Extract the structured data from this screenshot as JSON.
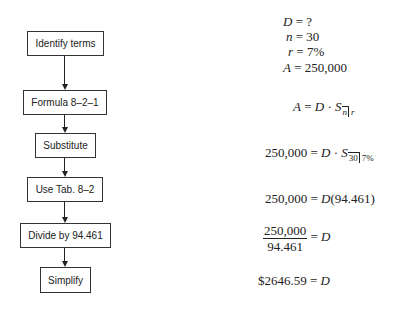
{
  "flowchart": {
    "steps": [
      {
        "label": "Identify terms"
      },
      {
        "label": "Formula 8–2–1"
      },
      {
        "label": "Substitute"
      },
      {
        "label": "Use Tab. 8–2"
      },
      {
        "label": "Divide by 94.461"
      },
      {
        "label": "Simplify"
      }
    ]
  },
  "equations": {
    "terms": {
      "d": {
        "var": "D",
        "op": "=",
        "val": "?"
      },
      "n": {
        "var": "n",
        "op": "=",
        "val": "30"
      },
      "r": {
        "var": "r",
        "op": "=",
        "val": "7%"
      },
      "a": {
        "var": "A",
        "op": "=",
        "val": "250,000"
      }
    },
    "formula": {
      "lhs": "A",
      "op": "=",
      "d": "D",
      "dot": "·",
      "s": "S",
      "sub_n": "n",
      "sub_r": "r"
    },
    "substitute": {
      "lhs": "250,000",
      "op": "=",
      "d": "D",
      "dot": "·",
      "s": "S",
      "sub_n": "30",
      "sub_r": "7%"
    },
    "table": {
      "lhs": "250,000",
      "op": "=",
      "d": "D",
      "rhs": "(94.461)"
    },
    "divide": {
      "num": "250,000",
      "den": "94.461",
      "op": "=",
      "d": "D"
    },
    "simplify": {
      "lhs": "$2646.59",
      "op": "=",
      "d": "D"
    }
  }
}
